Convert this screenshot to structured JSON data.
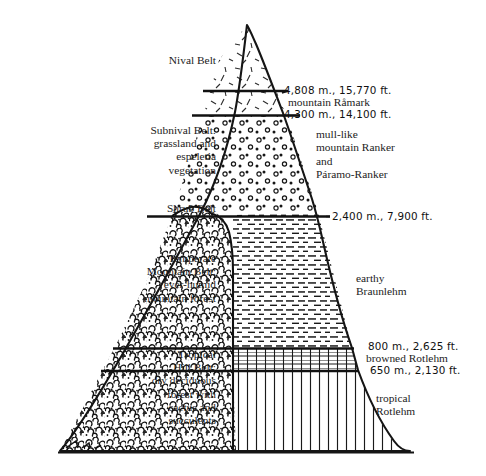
{
  "figure": {
    "type": "cross-section-diagram",
    "ink_color": "#1a1a1a",
    "background_color": "#ffffff"
  },
  "vegetation_belts": [
    {
      "id": "nival",
      "label": "Nival Belt",
      "texture": "short-dashes"
    },
    {
      "id": "subnival",
      "label": "Subnival Belt:\ngrassland and\nespeletia\nvegetation",
      "texture": "open-circles"
    },
    {
      "id": "shrub",
      "label": "Shrub Belt",
      "texture": "boundary"
    },
    {
      "id": "temperate",
      "label": "Temperate\nMountain Belt:\never-humid\nmountain forest",
      "texture": "cloud-canopy"
    },
    {
      "id": "tropical",
      "label": "Tropical\nHill Belt:\ndry deciduous\nforest with\ncactus and\nsucculents",
      "texture": "cloud-canopy"
    }
  ],
  "elevation_marks": [
    {
      "id": "m4808",
      "text": "4,808 m., 15,770 ft."
    },
    {
      "id": "m4300",
      "text": "4,300 m., 14,100 ft."
    },
    {
      "id": "m2400",
      "text": "2,400 m., 7,900 ft."
    },
    {
      "id": "m800",
      "text": "800 m., 2,625 ft."
    },
    {
      "id": "m650",
      "text": "650 m., 2,130 ft."
    }
  ],
  "peak_name": "mountain Råmark",
  "soil_types": [
    {
      "id": "ranker",
      "label": "mull-like\nmountain Ranker\nand\nPáramo-Ranker",
      "texture": "open-circles"
    },
    {
      "id": "braunlehm",
      "label": "earthy\nBraunlehm",
      "texture": "horizontal-dashes"
    },
    {
      "id": "browned",
      "label": "browned Rotlehm",
      "texture": "cross-hatch-grid"
    },
    {
      "id": "rotlehm",
      "label": "tropical\nRotlehm",
      "texture": "vertical-lines"
    }
  ]
}
